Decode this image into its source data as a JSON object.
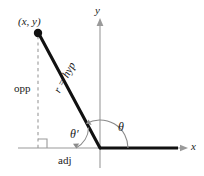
{
  "figure": {
    "labels": {
      "point": "(x, y)",
      "opposite": "opp",
      "adjacent": "adj",
      "hypotenuse": "r = hyp",
      "angle_standard": "θ",
      "angle_reference": "θ′",
      "axis_x": "x",
      "axis_y": "y"
    },
    "colors": {
      "stroke_dark": "#111111",
      "stroke_axis": "#999999",
      "stroke_arc": "#8a8a8a",
      "stroke_dashed": "#9a9a9a",
      "background": "#ffffff"
    },
    "geometry": {
      "origin": {
        "x": 100,
        "y": 148
      },
      "terminal_point": {
        "x": 38,
        "y": 33
      },
      "x_axis_left": 18,
      "x_axis_right": 186,
      "y_axis_top": 20,
      "y_axis_bottom": 168,
      "foot_of_perpendicular": {
        "x": 38,
        "y": 148
      },
      "right_angle_marker_size": 9,
      "theta_arc_radius": 28,
      "theta_prime_arc_radius": 24
    }
  }
}
